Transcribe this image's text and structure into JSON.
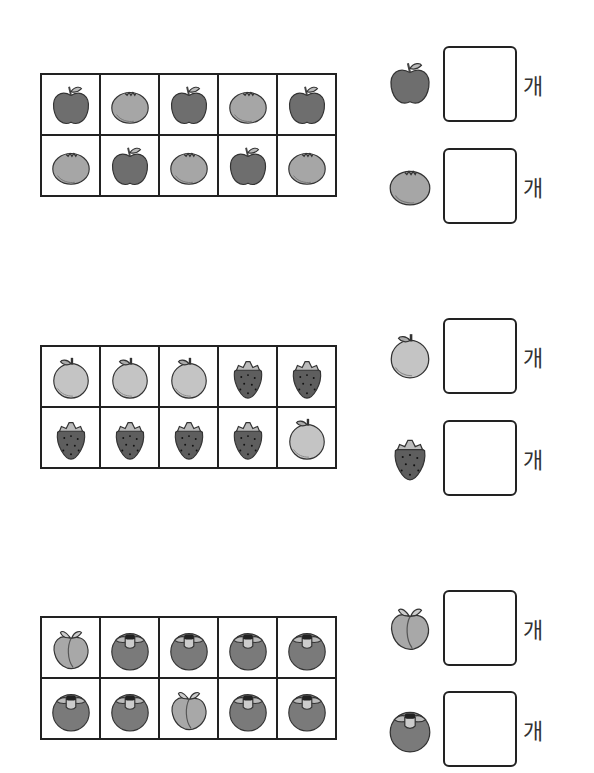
{
  "worksheet": {
    "sections": [
      {
        "id": "apple-tangerine",
        "top": 73,
        "grid": [
          [
            "apple",
            "tangerine",
            "apple",
            "tangerine",
            "apple"
          ],
          [
            "tangerine",
            "apple",
            "tangerine",
            "apple",
            "tangerine"
          ]
        ],
        "answers": [
          {
            "fruit": "apple",
            "top": 46,
            "unit": "개"
          },
          {
            "fruit": "tangerine",
            "top": 148,
            "unit": "개"
          }
        ]
      },
      {
        "id": "pear-strawberry",
        "top": 345,
        "grid": [
          [
            "pear",
            "pear",
            "pear",
            "strawberry",
            "strawberry"
          ],
          [
            "strawberry",
            "strawberry",
            "strawberry",
            "strawberry",
            "pear"
          ]
        ],
        "answers": [
          {
            "fruit": "pear",
            "top": 318,
            "unit": "개"
          },
          {
            "fruit": "strawberry",
            "top": 420,
            "unit": "개"
          }
        ]
      },
      {
        "id": "peach-persimmon",
        "top": 616,
        "grid": [
          [
            "peach",
            "persimmon",
            "persimmon",
            "persimmon",
            "persimmon"
          ],
          [
            "persimmon",
            "persimmon",
            "peach",
            "persimmon",
            "persimmon"
          ]
        ],
        "answers": [
          {
            "fruit": "peach",
            "top": 590,
            "unit": "개"
          },
          {
            "fruit": "persimmon",
            "top": 691,
            "unit": "개"
          }
        ]
      }
    ]
  },
  "colors": {
    "apple": "#6e6e6e",
    "tangerine": "#a6a6a6",
    "pear": "#c4c4c4",
    "strawberry": "#5e5e5e",
    "peach": "#a8a8a8",
    "persimmon": "#7a7a7a",
    "border": "#222222"
  }
}
